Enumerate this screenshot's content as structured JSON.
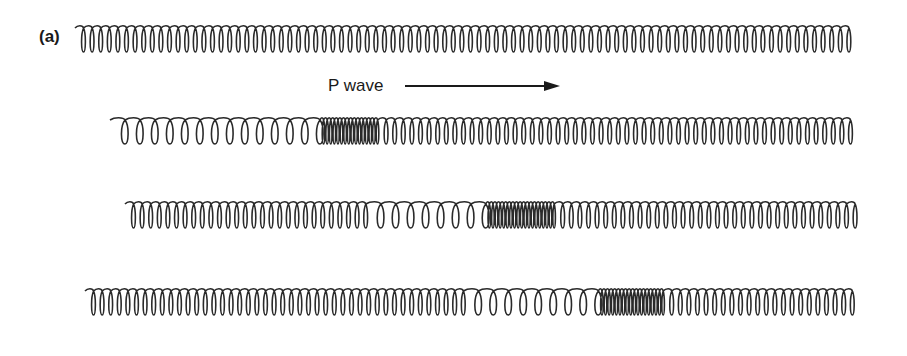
{
  "figure": {
    "panel_label": "(a)",
    "wave_label": "P wave",
    "arrow": {
      "x1": 405,
      "x2": 560,
      "y": 86,
      "direction": "right"
    },
    "stroke_color": "#2a2a2a",
    "springs": [
      {
        "name": "spring-row-1-rest",
        "x_start": 75,
        "x_end": 857,
        "y_center": 39,
        "height": 26,
        "segments": [
          {
            "from": 75,
            "to": 857,
            "pitch": 8.6
          }
        ]
      },
      {
        "name": "spring-row-2",
        "x_start": 110,
        "x_end": 857,
        "y_center": 131,
        "height": 26,
        "segments": [
          {
            "from": 110,
            "to": 322,
            "pitch": 15
          },
          {
            "from": 322,
            "to": 380,
            "pitch": 3.6
          },
          {
            "from": 380,
            "to": 857,
            "pitch": 8.6
          }
        ]
      },
      {
        "name": "spring-row-3",
        "x_start": 125,
        "x_end": 857,
        "y_center": 215,
        "height": 26,
        "segments": [
          {
            "from": 125,
            "to": 370,
            "pitch": 8.6
          },
          {
            "from": 370,
            "to": 497,
            "pitch": 15
          },
          {
            "from": 497,
            "to": 556,
            "pitch": 3.6
          },
          {
            "from": 556,
            "to": 857,
            "pitch": 8.6
          }
        ]
      },
      {
        "name": "spring-row-4",
        "x_start": 85,
        "x_end": 857,
        "y_center": 302,
        "height": 26,
        "segments": [
          {
            "from": 85,
            "to": 470,
            "pitch": 8.6
          },
          {
            "from": 470,
            "to": 604,
            "pitch": 15
          },
          {
            "from": 604,
            "to": 665,
            "pitch": 3.6
          },
          {
            "from": 665,
            "to": 857,
            "pitch": 8.6
          }
        ]
      }
    ]
  }
}
